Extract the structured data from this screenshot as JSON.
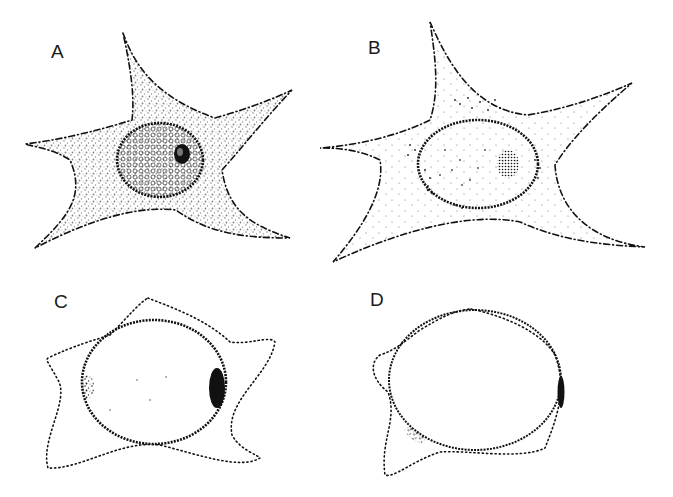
{
  "figure": {
    "panels": [
      {
        "id": "A",
        "label": "A",
        "description": "Stellate cell with dense granular cytoplasm, textured nucleus and dark nucleolus"
      },
      {
        "id": "B",
        "label": "B",
        "description": "Stellate cell with sparse cytoplasmic granules, clear nucleus with stippled nucleolus"
      },
      {
        "id": "C",
        "label": "C",
        "description": "Rounded cell with short processes, enlarged nucleus with crescent of dark material"
      },
      {
        "id": "D",
        "label": "D",
        "description": "Nearly round cell, nucleus fills cell, small residual cytoplasmic bleb"
      }
    ],
    "colors": {
      "ink": "#111111",
      "background": "#ffffff"
    }
  }
}
